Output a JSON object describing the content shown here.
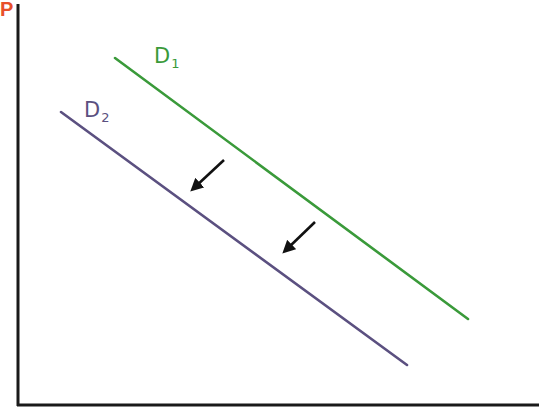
{
  "diagram": {
    "axes": {
      "y_label": "P",
      "x_label": "",
      "y_label_color": "#e8502a",
      "axis_color": "#1a1a1a"
    },
    "curves": [
      {
        "id": "D1",
        "label_main": "D",
        "label_sub": "1",
        "color": "#3a9a3a",
        "start": [
          115,
          58
        ],
        "end": [
          468,
          319
        ]
      },
      {
        "id": "D2",
        "label_main": "D",
        "label_sub": "2",
        "color": "#5b5080",
        "start": [
          61,
          112
        ],
        "end": [
          407,
          365
        ]
      }
    ],
    "arrows": [
      {
        "from": [
          224,
          160
        ],
        "to": [
          195,
          187
        ],
        "direction": "down-left"
      },
      {
        "from": [
          315,
          222
        ],
        "to": [
          287,
          249
        ],
        "direction": "down-left"
      }
    ],
    "arrow_color": "#111111"
  }
}
